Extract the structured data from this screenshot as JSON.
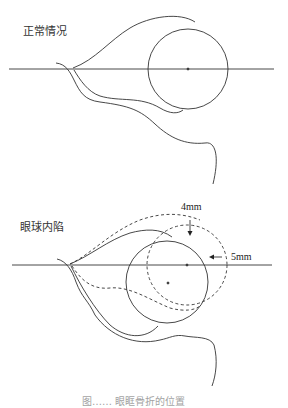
{
  "figure": {
    "panels": [
      {
        "label": "正常情况",
        "axis_y": 69,
        "eyeball": {
          "cx": 188,
          "cy": 69,
          "r": 40
        }
      },
      {
        "label": "眼球内陷",
        "axis_y": 265,
        "eyeball_original": {
          "cx": 187,
          "cy": 265,
          "r": 40,
          "style": "dashed"
        },
        "eyeball_displaced": {
          "cx": 167,
          "cy": 282,
          "r": 41,
          "style": "solid"
        },
        "annotations": [
          {
            "text": "4mm",
            "direction": "down"
          },
          {
            "text": "5mm",
            "direction": "left"
          }
        ]
      }
    ],
    "caption": "图……    眼眶骨折的位置"
  },
  "colors": {
    "line": "#333333",
    "background": "#ffffff"
  }
}
